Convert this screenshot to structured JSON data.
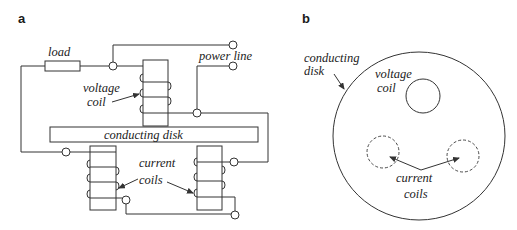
{
  "panels": {
    "a": {
      "label": "a",
      "texts": {
        "load": "load",
        "power_line": "power line",
        "voltage_coil_1": "voltage",
        "voltage_coil_2": "coil",
        "conducting_disk": "conducting disk",
        "current_coils_1": "current",
        "current_coils_2": "coils"
      }
    },
    "b": {
      "label": "b",
      "texts": {
        "conducting_disk_1": "conducting",
        "conducting_disk_2": "disk",
        "voltage_coil_1": "voltage",
        "voltage_coil_2": "coil",
        "current_coils_1": "current",
        "current_coils_2": "coils"
      }
    }
  },
  "colors": {
    "line": "#333333",
    "background": "#ffffff",
    "text": "#222222"
  }
}
